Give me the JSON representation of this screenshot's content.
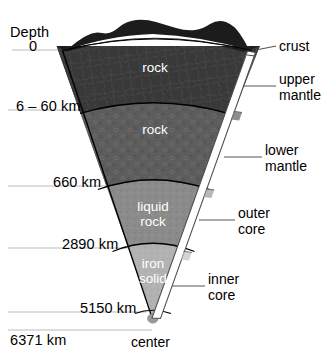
{
  "diagram": {
    "axis": {
      "depth_header": "Depth",
      "depth_ticks": [
        {
          "id": "surface",
          "label": "0",
          "y": 50
        },
        {
          "id": "moho",
          "label": "6 – 60 km",
          "y": 110
        },
        {
          "id": "mantle-660",
          "label": "660 km",
          "y": 186
        },
        {
          "id": "cmb-2890",
          "label": "2890 km",
          "y": 248
        },
        {
          "id": "icb-5150",
          "label": "5150 km",
          "y": 312
        },
        {
          "id": "radius-6371",
          "label": "6371 km",
          "y": 330
        }
      ]
    },
    "layers": [
      {
        "id": "crust",
        "inner_label": "",
        "color": "#1c1c1c"
      },
      {
        "id": "upper-mantle",
        "inner_label": "rock",
        "color": "#393939"
      },
      {
        "id": "lower-mantle",
        "inner_label": "rock",
        "color": "#5d5d5d"
      },
      {
        "id": "outer-core",
        "inner_label": "liquid\nrock",
        "color": "#8b8b8b"
      },
      {
        "id": "inner-core",
        "inner_label": "iron\nsolid",
        "color": "#b2b2b2"
      }
    ],
    "inner_labels": {
      "upper_mantle": "rock",
      "lower_mantle": "rock",
      "outer_core_line1": "liquid",
      "outer_core_line2": "rock",
      "inner_core_line1": "iron",
      "inner_core_line2": "solid"
    },
    "side_labels": {
      "crust": "crust",
      "upper_mantle_line1": "upper",
      "upper_mantle_line2": "mantle",
      "lower_mantle_line1": "lower",
      "lower_mantle_line2": "mantle",
      "outer_core_line1": "outer",
      "outer_core_line2": "core",
      "inner_core_line1": "inner",
      "inner_core_line2": "core"
    },
    "center_label": "center",
    "colors": {
      "crust": "#1c1c1c",
      "upper_mantle": "#393939",
      "lower_mantle": "#5d5d5d",
      "outer_core": "#8b8b8b",
      "inner_core": "#b2b2b2",
      "center_dot": "#9a9a9a",
      "guide_line": "#b9b9b9",
      "leader_line": "#555555",
      "bracket": "#ffffff",
      "outline": "#000000",
      "background": "#ffffff"
    }
  }
}
